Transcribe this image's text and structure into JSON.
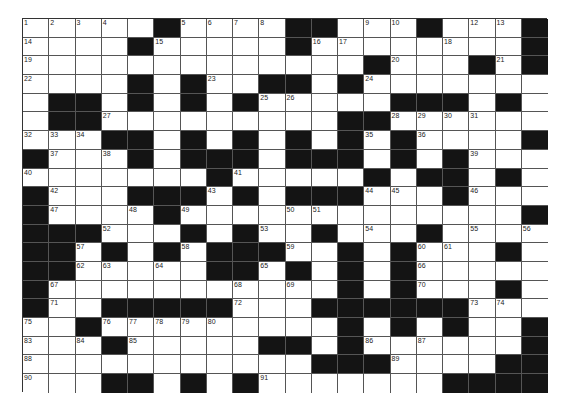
{
  "puzzle": {
    "rows": 20,
    "cols": 20,
    "colors": {
      "black_cell": "#141414",
      "white_cell": "#ffffff",
      "grid_line": "#555555"
    },
    "layout": [
      "11111011110011101110",
      "11110111110111111110",
      "11111111111110111010",
      "11110101100101111111",
      "10010101011111000101",
      "10011111111100111111",
      "11100101010101011110",
      "01110100010001010111",
      "11111110111110100101",
      "01110001010001110111",
      "01111011111111111110",
      "00011101011011101111",
      "00101010001101011101",
      "00111110010101011111",
      "01111111111101011101",
      "01100000111000000111",
      "11011111111101010110",
      "11101111100101111110",
      "11111111111000111100",
      "11100101011111110000"
    ],
    "numbers": [
      {
        "r": 0,
        "c": 0,
        "n": "1"
      },
      {
        "r": 0,
        "c": 1,
        "n": "2"
      },
      {
        "r": 0,
        "c": 2,
        "n": "3"
      },
      {
        "r": 0,
        "c": 3,
        "n": "4"
      },
      {
        "r": 0,
        "c": 6,
        "n": "5"
      },
      {
        "r": 0,
        "c": 7,
        "n": "6"
      },
      {
        "r": 0,
        "c": 8,
        "n": "7"
      },
      {
        "r": 0,
        "c": 9,
        "n": "8"
      },
      {
        "r": 0,
        "c": 13,
        "n": "9"
      },
      {
        "r": 0,
        "c": 14,
        "n": "10"
      },
      {
        "r": 0,
        "c": 15,
        "n": "11"
      },
      {
        "r": 0,
        "c": 17,
        "n": "12"
      },
      {
        "r": 0,
        "c": 18,
        "n": "13"
      },
      {
        "r": 1,
        "c": 0,
        "n": "14"
      },
      {
        "r": 1,
        "c": 5,
        "n": "15"
      },
      {
        "r": 1,
        "c": 11,
        "n": "16"
      },
      {
        "r": 1,
        "c": 12,
        "n": "17"
      },
      {
        "r": 1,
        "c": 16,
        "n": "18"
      },
      {
        "r": 2,
        "c": 0,
        "n": "19"
      },
      {
        "r": 2,
        "c": 14,
        "n": "20"
      },
      {
        "r": 2,
        "c": 18,
        "n": "21"
      },
      {
        "r": 3,
        "c": 0,
        "n": "22"
      },
      {
        "r": 3,
        "c": 7,
        "n": "23"
      },
      {
        "r": 3,
        "c": 13,
        "n": "24"
      },
      {
        "r": 4,
        "c": 9,
        "n": "25"
      },
      {
        "r": 4,
        "c": 10,
        "n": "26"
      },
      {
        "r": 5,
        "c": 3,
        "n": "27"
      },
      {
        "r": 5,
        "c": 14,
        "n": "28"
      },
      {
        "r": 5,
        "c": 15,
        "n": "29"
      },
      {
        "r": 5,
        "c": 16,
        "n": "30"
      },
      {
        "r": 5,
        "c": 17,
        "n": "31"
      },
      {
        "r": 6,
        "c": 0,
        "n": "32"
      },
      {
        "r": 6,
        "c": 1,
        "n": "33"
      },
      {
        "r": 6,
        "c": 2,
        "n": "34"
      },
      {
        "r": 6,
        "c": 13,
        "n": "35"
      },
      {
        "r": 6,
        "c": 15,
        "n": "36"
      },
      {
        "r": 7,
        "c": 1,
        "n": "37"
      },
      {
        "r": 7,
        "c": 3,
        "n": "38"
      },
      {
        "r": 7,
        "c": 17,
        "n": "39"
      },
      {
        "r": 8,
        "c": 0,
        "n": "40"
      },
      {
        "r": 8,
        "c": 8,
        "n": "41"
      },
      {
        "r": 9,
        "c": 1,
        "n": "42"
      },
      {
        "r": 9,
        "c": 7,
        "n": "43"
      },
      {
        "r": 9,
        "c": 13,
        "n": "44"
      },
      {
        "r": 9,
        "c": 14,
        "n": "45"
      },
      {
        "r": 9,
        "c": 17,
        "n": "46"
      },
      {
        "r": 10,
        "c": 1,
        "n": "47"
      },
      {
        "r": 10,
        "c": 4,
        "n": "48"
      },
      {
        "r": 10,
        "c": 6,
        "n": "49"
      },
      {
        "r": 10,
        "c": 10,
        "n": "50"
      },
      {
        "r": 10,
        "c": 11,
        "n": "51"
      },
      {
        "r": 11,
        "c": 3,
        "n": "52"
      },
      {
        "r": 11,
        "c": 9,
        "n": "53"
      },
      {
        "r": 11,
        "c": 13,
        "n": "54"
      },
      {
        "r": 11,
        "c": 17,
        "n": "55"
      },
      {
        "r": 11,
        "c": 19,
        "n": "56"
      },
      {
        "r": 12,
        "c": 2,
        "n": "57"
      },
      {
        "r": 12,
        "c": 6,
        "n": "58"
      },
      {
        "r": 12,
        "c": 10,
        "n": "59"
      },
      {
        "r": 12,
        "c": 15,
        "n": "60"
      },
      {
        "r": 12,
        "c": 16,
        "n": "61"
      },
      {
        "r": 13,
        "c": 2,
        "n": "62"
      },
      {
        "r": 13,
        "c": 3,
        "n": "63"
      },
      {
        "r": 13,
        "c": 5,
        "n": "64"
      },
      {
        "r": 13,
        "c": 9,
        "n": "65"
      },
      {
        "r": 13,
        "c": 15,
        "n": "66"
      },
      {
        "r": 14,
        "c": 1,
        "n": "67"
      },
      {
        "r": 14,
        "c": 8,
        "n": "68"
      },
      {
        "r": 14,
        "c": 10,
        "n": "69"
      },
      {
        "r": 14,
        "c": 15,
        "n": "70"
      },
      {
        "r": 15,
        "c": 1,
        "n": "71"
      },
      {
        "r": 15,
        "c": 8,
        "n": "72"
      },
      {
        "r": 15,
        "c": 17,
        "n": "73"
      },
      {
        "r": 15,
        "c": 18,
        "n": "74"
      },
      {
        "r": 16,
        "c": 0,
        "n": "75"
      },
      {
        "r": 16,
        "c": 3,
        "n": "76"
      },
      {
        "r": 16,
        "c": 4,
        "n": "77"
      },
      {
        "r": 16,
        "c": 5,
        "n": "78"
      },
      {
        "r": 16,
        "c": 6,
        "n": "79"
      },
      {
        "r": 16,
        "c": 7,
        "n": "80"
      },
      {
        "r": 16,
        "c": 14,
        "n": "81"
      },
      {
        "r": 16,
        "c": 16,
        "n": "82"
      },
      {
        "r": 17,
        "c": 0,
        "n": "83"
      },
      {
        "r": 17,
        "c": 2,
        "n": "84"
      },
      {
        "r": 17,
        "c": 4,
        "n": "85"
      },
      {
        "r": 17,
        "c": 13,
        "n": "86"
      },
      {
        "r": 17,
        "c": 15,
        "n": "87"
      },
      {
        "r": 18,
        "c": 0,
        "n": "88"
      },
      {
        "r": 18,
        "c": 14,
        "n": "89"
      },
      {
        "r": 19,
        "c": 0,
        "n": "90"
      },
      {
        "r": 19,
        "c": 9,
        "n": "91"
      }
    ]
  }
}
